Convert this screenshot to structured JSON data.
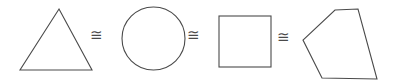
{
  "figure": {
    "name": "congruent-shapes-row",
    "background_color": "#ffffff",
    "stroke_color": "#4a4a4a",
    "stroke_width": 1.1,
    "width": 395,
    "height": 83,
    "shapes": [
      {
        "id": "triangle",
        "label": "triangle",
        "kind": "polygon",
        "points": "59,9 92,70 20,70",
        "bbox": [
          20,
          9,
          72,
          61
        ]
      },
      {
        "id": "ellipse",
        "label": "ellipse",
        "kind": "ellipse",
        "cx": 153.5,
        "cy": 38.5,
        "rx": 31.5,
        "ry": 31.5,
        "bbox": [
          122,
          7,
          63,
          63
        ]
      },
      {
        "id": "square",
        "label": "square",
        "kind": "rect",
        "x": 219,
        "y": 16,
        "width": 52,
        "height": 51,
        "bbox": [
          219,
          16,
          52,
          51
        ]
      },
      {
        "id": "quadrilateral",
        "label": "quadrilateral",
        "kind": "polygon",
        "points": "335,10 358,9 377,79 322,78 303,40",
        "bbox": [
          303,
          9,
          74,
          70
        ]
      }
    ],
    "relations": [
      {
        "id": "congruence-1",
        "symbol": "≅",
        "name": "congruent-to",
        "x": 90,
        "y": 28
      },
      {
        "id": "congruence-2",
        "symbol": "≅",
        "name": "congruent-to",
        "x": 187,
        "y": 28
      },
      {
        "id": "congruence-3",
        "symbol": "≅",
        "name": "congruent-to",
        "x": 277,
        "y": 30
      }
    ]
  }
}
